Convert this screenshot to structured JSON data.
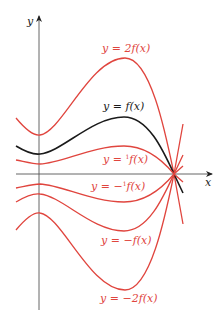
{
  "diagram": {
    "axes": {
      "x_label": "x",
      "y_label": "y"
    },
    "colors": {
      "base_curve": "#1a1a1a",
      "transformed_curves": "#e0453e",
      "axes": "#555555"
    },
    "curves": [
      {
        "id": "2f",
        "label": "y = 2f(x)",
        "color": "#e0453e"
      },
      {
        "id": "f",
        "label": "y = f(x)",
        "color": "#1a1a1a"
      },
      {
        "id": "half_f",
        "label_prefix": "y = ",
        "label_fraction": "1/2",
        "label_suffix": "f(x)",
        "color": "#e0453e"
      },
      {
        "id": "neg_half_f",
        "label_prefix": "y = −",
        "label_fraction": "1/2",
        "label_suffix": "f(x)",
        "color": "#e0453e"
      },
      {
        "id": "neg_f",
        "label": "y = −f(x)",
        "color": "#e0453e"
      },
      {
        "id": "neg_2f",
        "label": "y = −2f(x)",
        "color": "#e0453e"
      }
    ],
    "frac": {
      "num": "1",
      "den": "2"
    }
  }
}
